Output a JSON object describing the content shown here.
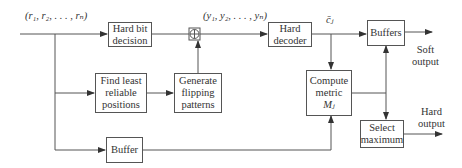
{
  "diagram": {
    "type": "block-diagram",
    "signals": {
      "input": "(r₁, r₂, . . . , rₙ)",
      "hard_bits": "(y₁, y₂, . . . , yₙ)",
      "codeword": "c̄ⱼ"
    },
    "blocks": {
      "hard_bit_decision": [
        "Hard bit",
        "decision"
      ],
      "hard_decoder": [
        "Hard",
        "decoder"
      ],
      "buffers": [
        "Buffers"
      ],
      "find_least_reliable": [
        "Find least",
        "reliable",
        "positions"
      ],
      "generate_flipping": [
        "Generate",
        "flipping",
        "patterns"
      ],
      "compute_metric": [
        "Compute",
        "metric",
        "Mⱼ"
      ],
      "select_maximum": [
        "Select",
        "maximum"
      ],
      "buffer": [
        "Buffer"
      ]
    },
    "outputs": {
      "soft": [
        "Soft",
        "output"
      ],
      "hard": [
        "Hard",
        "output"
      ]
    },
    "connections": [
      {
        "from": "input",
        "to": "hard_bit_decision"
      },
      {
        "from": "input",
        "to": "find_least_reliable"
      },
      {
        "from": "input",
        "to": "buffer"
      },
      {
        "from": "hard_bit_decision",
        "to": "xor"
      },
      {
        "from": "find_least_reliable",
        "to": "generate_flipping"
      },
      {
        "from": "generate_flipping",
        "to": "xor"
      },
      {
        "from": "xor",
        "to": "hard_decoder"
      },
      {
        "from": "hard_decoder",
        "to": "buffers"
      },
      {
        "from": "hard_decoder",
        "to": "compute_metric"
      },
      {
        "from": "buffer",
        "to": "compute_metric"
      },
      {
        "from": "compute_metric",
        "to": "buffers"
      },
      {
        "from": "compute_metric",
        "to": "select_maximum"
      },
      {
        "from": "buffers",
        "to": "soft_output"
      },
      {
        "from": "select_maximum",
        "to": "hard_output"
      }
    ]
  }
}
